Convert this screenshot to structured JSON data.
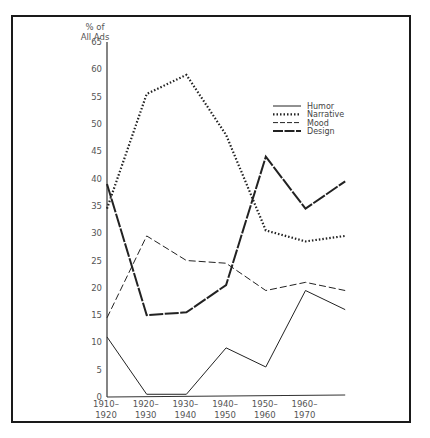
{
  "chart_data": {
    "type": "line",
    "title": "",
    "ylabel": "% of All Ads",
    "ylabel_lines": [
      "% of",
      "All Ads"
    ],
    "xlabel": "",
    "ylim": [
      0,
      65
    ],
    "yticks": [
      0,
      5,
      10,
      15,
      20,
      25,
      30,
      35,
      40,
      45,
      50,
      55,
      60,
      65
    ],
    "categories": [
      "1910–1920",
      "1920–1930",
      "1930–1940",
      "1940–1950",
      "1950–1960",
      "1960–1970",
      ""
    ],
    "category_labels": [
      [
        "1910–",
        "1920"
      ],
      [
        "1920–",
        "1930"
      ],
      [
        "1930–",
        "1940"
      ],
      [
        "1940–",
        "1950"
      ],
      [
        "1950–",
        "1960"
      ],
      [
        "1960–",
        "1970"
      ]
    ],
    "grid": false,
    "legend_position": "upper right",
    "series": [
      {
        "name": "Humor",
        "style": "solid-thin",
        "values": [
          11,
          0.5,
          0.5,
          9,
          5.5,
          19.5,
          16
        ]
      },
      {
        "name": "Narrative",
        "style": "dotted",
        "values": [
          34.5,
          55.5,
          59,
          48,
          30.5,
          28.5,
          29.5
        ]
      },
      {
        "name": "Mood",
        "style": "dashed",
        "values": [
          14.5,
          29.5,
          25,
          24.5,
          19.5,
          21,
          19.5
        ]
      },
      {
        "name": "Design",
        "style": "dash-thick",
        "values": [
          39,
          15,
          15.5,
          20.5,
          44,
          34.5,
          39.5
        ]
      }
    ]
  },
  "colors": {
    "line": "#222222",
    "axis": "#333333",
    "text": "#555555",
    "frame": "#1a1a1a"
  }
}
